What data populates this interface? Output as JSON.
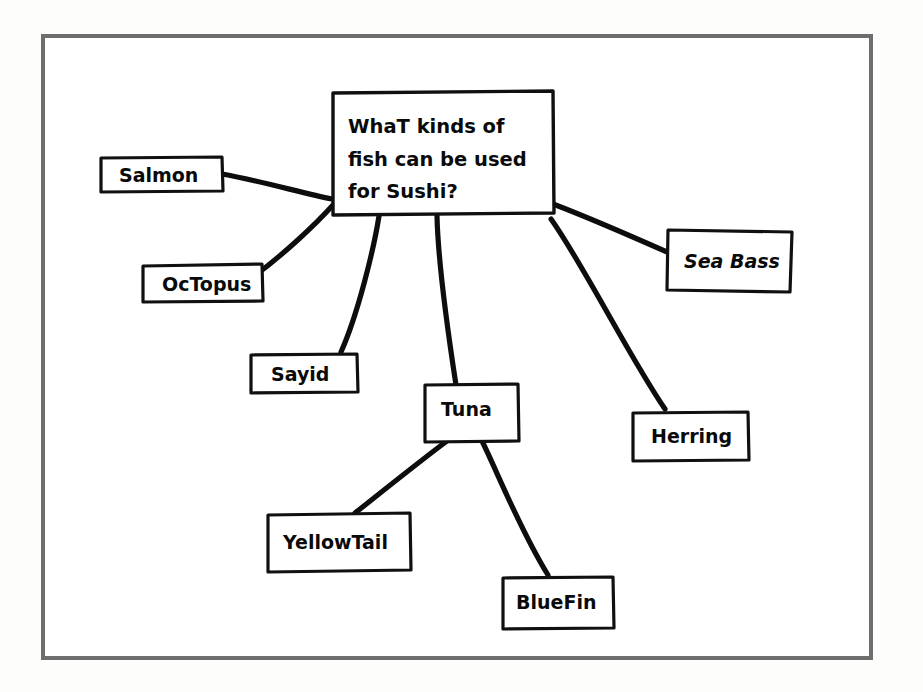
{
  "diagram": {
    "frame_color": "#6e6e6e",
    "ink_color": "#0d0d0d",
    "paper_color": "#ffffff",
    "central_node": {
      "id": "central",
      "line1": "WhaT kinds of",
      "line2": "fish can be used",
      "line3": "for Sushi?"
    },
    "nodes": [
      {
        "id": "salmon",
        "label": "Salmon"
      },
      {
        "id": "octopus",
        "label": "OcTopus"
      },
      {
        "id": "sayid",
        "label": "Sayid"
      },
      {
        "id": "tuna",
        "label": "Tuna"
      },
      {
        "id": "sea-bass",
        "label": "Sea Bass"
      },
      {
        "id": "herring",
        "label": "Herring"
      },
      {
        "id": "yellowtail",
        "label": "YellowTail"
      },
      {
        "id": "bluefin",
        "label": "BlueFin"
      }
    ],
    "connections": [
      {
        "from": "central",
        "to": "salmon"
      },
      {
        "from": "central",
        "to": "octopus"
      },
      {
        "from": "central",
        "to": "sayid"
      },
      {
        "from": "central",
        "to": "tuna"
      },
      {
        "from": "central",
        "to": "sea-bass"
      },
      {
        "from": "central",
        "to": "herring"
      },
      {
        "from": "tuna",
        "to": "yellowtail"
      },
      {
        "from": "tuna",
        "to": "bluefin"
      }
    ]
  }
}
